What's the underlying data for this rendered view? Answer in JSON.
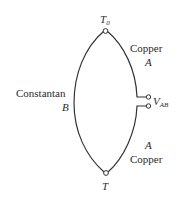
{
  "diagram": {
    "type": "thermocouple",
    "colors": {
      "wire": "#333333",
      "text": "#2a2a2a",
      "background": "#ffffff"
    },
    "junctions": {
      "top": {
        "label_main": "T",
        "label_sub": "0"
      },
      "bottom": {
        "label_main": "T"
      }
    },
    "wires": {
      "left": {
        "material": "Constantan",
        "letter": "B"
      },
      "upper_right": {
        "material": "Copper",
        "letter": "A"
      },
      "lower_right": {
        "material": "Copper",
        "letter": "A"
      }
    },
    "terminal": {
      "label_main": "V",
      "label_sub": "AB"
    }
  }
}
